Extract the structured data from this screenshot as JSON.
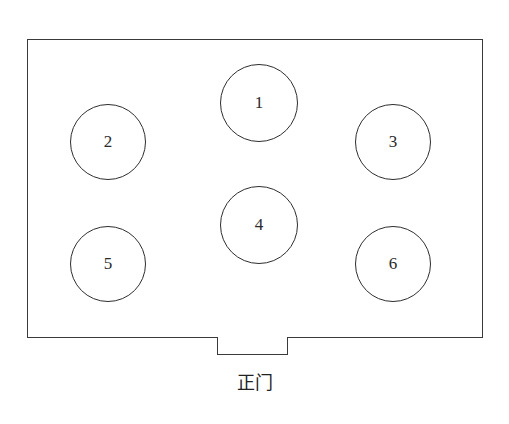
{
  "diagram": {
    "type": "floor-plan",
    "room": {
      "shape": "rectangle",
      "border_color": "#3a3a3a"
    },
    "tables": [
      {
        "label": "1",
        "cx": 259,
        "cy": 103,
        "r": 39
      },
      {
        "label": "2",
        "cx": 108,
        "cy": 142,
        "r": 38
      },
      {
        "label": "3",
        "cx": 393,
        "cy": 142,
        "r": 38
      },
      {
        "label": "4",
        "cx": 259,
        "cy": 225,
        "r": 39
      },
      {
        "label": "5",
        "cx": 108,
        "cy": 264,
        "r": 38
      },
      {
        "label": "6",
        "cx": 393,
        "cy": 264,
        "r": 38
      }
    ],
    "door": {
      "label": "正门",
      "position": "bottom-center"
    }
  }
}
